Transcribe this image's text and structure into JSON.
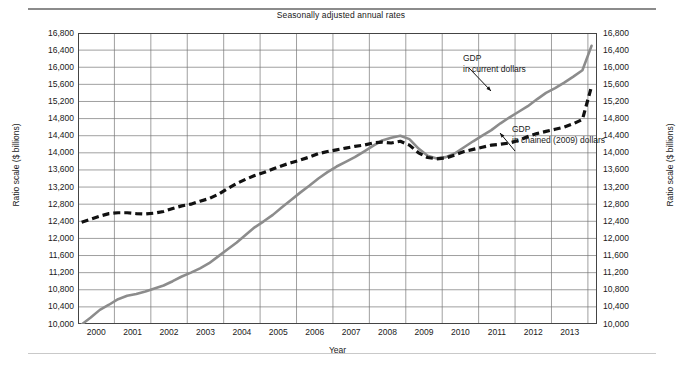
{
  "figure": {
    "title": "Seasonally adjusted annual rates",
    "y_axis_label_left": "Ratio scale ($ billions)",
    "y_axis_label_right": "Ratio scale ($ billions)",
    "x_axis_label": "Year"
  },
  "annotations": [
    {
      "id": "gdp-current",
      "line1": "GDP",
      "line2": "in current dollars"
    },
    {
      "id": "gdp-chained",
      "line1": "GDP",
      "line2": "in chained (2009) dollars"
    }
  ],
  "chart_data": {
    "type": "line",
    "title": "Seasonally adjusted annual rates",
    "xlabel": "Year",
    "ylabel": "Ratio scale ($ billions)",
    "xlim": [
      1999.5,
      2013.75
    ],
    "ylim": [
      10000,
      16800
    ],
    "grid": true,
    "legend": "annotations on plot",
    "yticks": [
      10000,
      10400,
      10800,
      11200,
      11600,
      12000,
      12400,
      12800,
      13200,
      13600,
      14000,
      14400,
      14800,
      15200,
      15600,
      16000,
      16400,
      16800
    ],
    "ytick_labels": [
      "10,000",
      "10,400",
      "10,800",
      "11,200",
      "11,600",
      "12,000",
      "12,400",
      "12,800",
      "13,200",
      "13,600",
      "14,000",
      "14,400",
      "14,800",
      "15,200",
      "15,600",
      "16,000",
      "16,400",
      "16,800"
    ],
    "xticks": [
      2000,
      2001,
      2002,
      2003,
      2004,
      2005,
      2006,
      2007,
      2008,
      2009,
      2010,
      2011,
      2012,
      2013
    ],
    "xtick_labels": [
      "2000",
      "2001",
      "2002",
      "2003",
      "2004",
      "2005",
      "2006",
      "2007",
      "2008",
      "2009",
      "2010",
      "2011",
      "2012",
      "2013"
    ],
    "series": [
      {
        "name": "GDP in current dollars",
        "style": "solid",
        "color": "#8c8c8c",
        "x": [
          1999.6,
          1999.85,
          2000.1,
          2000.35,
          2000.6,
          2000.85,
          2001.1,
          2001.35,
          2001.6,
          2001.85,
          2002.1,
          2002.35,
          2002.6,
          2002.85,
          2003.1,
          2003.35,
          2003.6,
          2003.85,
          2004.1,
          2004.35,
          2004.6,
          2004.85,
          2005.1,
          2005.35,
          2005.6,
          2005.85,
          2006.1,
          2006.35,
          2006.6,
          2006.85,
          2007.1,
          2007.35,
          2007.6,
          2007.85,
          2008.1,
          2008.35,
          2008.6,
          2008.85,
          2009.1,
          2009.35,
          2009.6,
          2009.85,
          2010.1,
          2010.35,
          2010.6,
          2010.85,
          2011.1,
          2011.35,
          2011.6,
          2011.85,
          2012.1,
          2012.35,
          2012.6,
          2012.85,
          2013.1,
          2013.35,
          2013.6
        ],
        "y": [
          9990,
          10150,
          10330,
          10450,
          10580,
          10660,
          10700,
          10760,
          10830,
          10900,
          11000,
          11110,
          11200,
          11300,
          11420,
          11580,
          11740,
          11900,
          12080,
          12260,
          12400,
          12550,
          12730,
          12900,
          13070,
          13230,
          13400,
          13550,
          13680,
          13790,
          13900,
          14030,
          14160,
          14290,
          14350,
          14400,
          14320,
          14100,
          13930,
          13870,
          13900,
          13990,
          14130,
          14270,
          14400,
          14530,
          14690,
          14830,
          14960,
          15090,
          15250,
          15400,
          15510,
          15640,
          15780,
          15930,
          16500
        ]
      },
      {
        "name": "GDP in chained (2009) dollars",
        "style": "dashed",
        "color": "#111111",
        "x": [
          1999.6,
          1999.85,
          2000.1,
          2000.35,
          2000.6,
          2000.85,
          2001.1,
          2001.35,
          2001.6,
          2001.85,
          2002.1,
          2002.35,
          2002.6,
          2002.85,
          2003.1,
          2003.35,
          2003.6,
          2003.85,
          2004.1,
          2004.35,
          2004.6,
          2004.85,
          2005.1,
          2005.35,
          2005.6,
          2005.85,
          2006.1,
          2006.35,
          2006.6,
          2006.85,
          2007.1,
          2007.35,
          2007.6,
          2007.85,
          2008.1,
          2008.35,
          2008.6,
          2008.85,
          2009.1,
          2009.35,
          2009.6,
          2009.85,
          2010.1,
          2010.35,
          2010.6,
          2010.85,
          2011.1,
          2011.35,
          2011.6,
          2011.85,
          2012.1,
          2012.35,
          2012.6,
          2012.85,
          2013.1,
          2013.35,
          2013.6
        ],
        "y": [
          12380,
          12450,
          12520,
          12580,
          12600,
          12600,
          12580,
          12570,
          12590,
          12630,
          12700,
          12760,
          12800,
          12870,
          12930,
          13030,
          13160,
          13280,
          13380,
          13470,
          13540,
          13620,
          13700,
          13770,
          13830,
          13900,
          13980,
          14030,
          14070,
          14110,
          14150,
          14180,
          14230,
          14250,
          14230,
          14270,
          14180,
          14000,
          13890,
          13860,
          13880,
          13950,
          14030,
          14080,
          14130,
          14180,
          14200,
          14230,
          14290,
          14380,
          14450,
          14500,
          14550,
          14600,
          14680,
          14780,
          15550
        ]
      }
    ]
  }
}
